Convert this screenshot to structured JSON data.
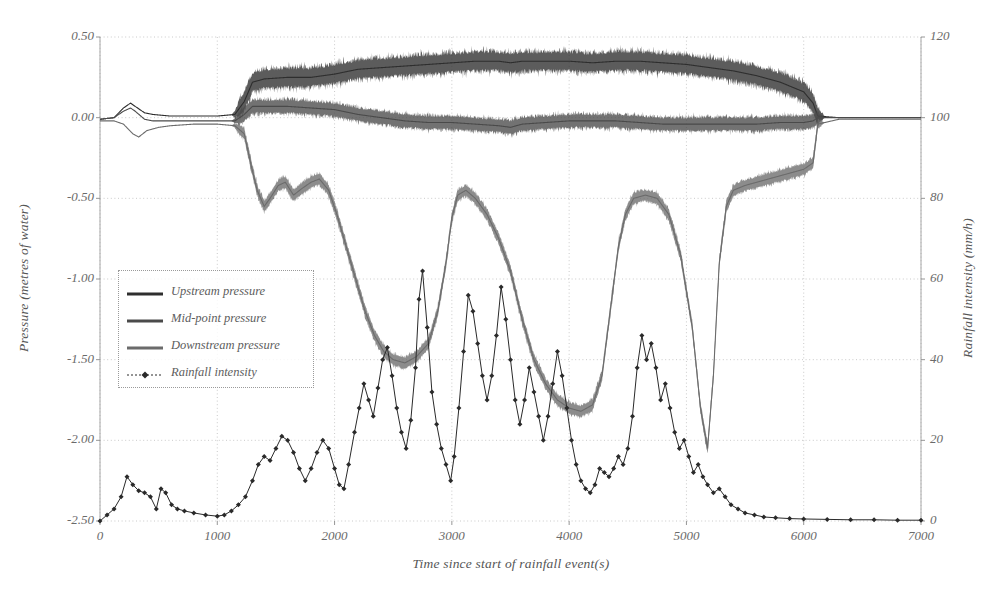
{
  "chart_data": {
    "type": "line",
    "title": "",
    "subtitle": "",
    "xlabel": "Time since start of rainfall event(s)",
    "ylabel": "Pressure (metres of water)",
    "ylabel_right": "Rainfall intensity (mm/h)",
    "xlim": [
      0,
      7000
    ],
    "ylim": [
      -2.5,
      0.5
    ],
    "ylim_right": [
      0,
      120
    ],
    "xticks": [
      0,
      1000,
      2000,
      3000,
      4000,
      5000,
      6000,
      7000
    ],
    "xticklabels": [
      "0",
      "1000",
      "2000",
      "3000",
      "4000",
      "5000",
      "6000",
      "7000"
    ],
    "yticks": [
      0.5,
      0.0,
      -0.5,
      -1.0,
      -1.5,
      -2.0,
      -2.5
    ],
    "yticklabels": [
      "0.50",
      "0.00",
      "-0.50",
      "-1.00",
      "-1.50",
      "-2.00",
      "-2.50"
    ],
    "yticks_right": [
      0,
      20,
      40,
      60,
      80,
      100,
      120
    ],
    "yticklabels_right": [
      "0",
      "20",
      "40",
      "60",
      "80",
      "100",
      "120"
    ],
    "grid": true,
    "grid_style": "dotted",
    "legend_position": "center-left",
    "series": [
      {
        "name": "Upstream pressure",
        "axis": "left",
        "color": "#2e2e2e",
        "style": "solid-noisy",
        "noise": 0.085,
        "points": [
          [
            0,
            -0.01
          ],
          [
            120,
            0.0
          ],
          [
            200,
            0.06
          ],
          [
            260,
            0.09
          ],
          [
            300,
            0.07
          ],
          [
            380,
            0.03
          ],
          [
            450,
            0.02
          ],
          [
            600,
            0.01
          ],
          [
            800,
            0.01
          ],
          [
            1000,
            0.01
          ],
          [
            1150,
            0.02
          ],
          [
            1230,
            0.1
          ],
          [
            1300,
            0.22
          ],
          [
            1400,
            0.24
          ],
          [
            1600,
            0.25
          ],
          [
            1800,
            0.25
          ],
          [
            2000,
            0.27
          ],
          [
            2200,
            0.3
          ],
          [
            2400,
            0.31
          ],
          [
            2600,
            0.32
          ],
          [
            2800,
            0.33
          ],
          [
            3000,
            0.34
          ],
          [
            3200,
            0.35
          ],
          [
            3400,
            0.35
          ],
          [
            3500,
            0.34
          ],
          [
            3600,
            0.35
          ],
          [
            3800,
            0.35
          ],
          [
            4000,
            0.35
          ],
          [
            4200,
            0.34
          ],
          [
            4400,
            0.35
          ],
          [
            4600,
            0.35
          ],
          [
            4800,
            0.34
          ],
          [
            5000,
            0.33
          ],
          [
            5200,
            0.31
          ],
          [
            5400,
            0.29
          ],
          [
            5600,
            0.26
          ],
          [
            5800,
            0.22
          ],
          [
            6000,
            0.16
          ],
          [
            6080,
            0.09
          ],
          [
            6120,
            0.01
          ],
          [
            6300,
            0.0
          ],
          [
            6600,
            0.0
          ],
          [
            7000,
            0.0
          ]
        ]
      },
      {
        "name": "Mid-point pressure",
        "axis": "left",
        "color": "#4a4a4a",
        "style": "solid-noisy",
        "noise": 0.06,
        "points": [
          [
            0,
            -0.01
          ],
          [
            120,
            0.0
          ],
          [
            200,
            0.04
          ],
          [
            260,
            0.06
          ],
          [
            300,
            0.04
          ],
          [
            380,
            -0.01
          ],
          [
            450,
            -0.02
          ],
          [
            600,
            -0.02
          ],
          [
            800,
            -0.02
          ],
          [
            1000,
            -0.02
          ],
          [
            1150,
            -0.02
          ],
          [
            1230,
            0.02
          ],
          [
            1300,
            0.07
          ],
          [
            1400,
            0.07
          ],
          [
            1600,
            0.07
          ],
          [
            1800,
            0.06
          ],
          [
            2000,
            0.05
          ],
          [
            2200,
            0.02
          ],
          [
            2400,
            0.0
          ],
          [
            2600,
            -0.02
          ],
          [
            2800,
            -0.03
          ],
          [
            3000,
            -0.03
          ],
          [
            3200,
            -0.04
          ],
          [
            3400,
            -0.05
          ],
          [
            3500,
            -0.06
          ],
          [
            3600,
            -0.04
          ],
          [
            3800,
            -0.03
          ],
          [
            4000,
            -0.02
          ],
          [
            4200,
            -0.02
          ],
          [
            4400,
            -0.02
          ],
          [
            4600,
            -0.03
          ],
          [
            4800,
            -0.04
          ],
          [
            5000,
            -0.04
          ],
          [
            5200,
            -0.04
          ],
          [
            5400,
            -0.04
          ],
          [
            5600,
            -0.04
          ],
          [
            5800,
            -0.03
          ],
          [
            6000,
            -0.03
          ],
          [
            6080,
            -0.02
          ],
          [
            6120,
            0.0
          ],
          [
            6300,
            0.0
          ],
          [
            6600,
            0.0
          ],
          [
            7000,
            0.0
          ]
        ]
      },
      {
        "name": "Downstream pressure",
        "axis": "left",
        "color": "#6b6b6b",
        "style": "solid-noisy",
        "noise": 0.05,
        "points": [
          [
            0,
            -0.02
          ],
          [
            120,
            -0.02
          ],
          [
            200,
            -0.04
          ],
          [
            280,
            -0.1
          ],
          [
            330,
            -0.12
          ],
          [
            400,
            -0.08
          ],
          [
            500,
            -0.06
          ],
          [
            600,
            -0.05
          ],
          [
            800,
            -0.04
          ],
          [
            1000,
            -0.04
          ],
          [
            1150,
            -0.05
          ],
          [
            1230,
            -0.1
          ],
          [
            1290,
            -0.3
          ],
          [
            1340,
            -0.45
          ],
          [
            1400,
            -0.55
          ],
          [
            1450,
            -0.5
          ],
          [
            1520,
            -0.42
          ],
          [
            1580,
            -0.4
          ],
          [
            1650,
            -0.48
          ],
          [
            1720,
            -0.44
          ],
          [
            1800,
            -0.4
          ],
          [
            1870,
            -0.38
          ],
          [
            1950,
            -0.45
          ],
          [
            2020,
            -0.6
          ],
          [
            2100,
            -0.8
          ],
          [
            2180,
            -1.0
          ],
          [
            2260,
            -1.2
          ],
          [
            2340,
            -1.35
          ],
          [
            2420,
            -1.45
          ],
          [
            2500,
            -1.5
          ],
          [
            2600,
            -1.52
          ],
          [
            2700,
            -1.48
          ],
          [
            2800,
            -1.4
          ],
          [
            2880,
            -1.2
          ],
          [
            2950,
            -0.9
          ],
          [
            3000,
            -0.62
          ],
          [
            3050,
            -0.48
          ],
          [
            3120,
            -0.45
          ],
          [
            3200,
            -0.5
          ],
          [
            3300,
            -0.6
          ],
          [
            3400,
            -0.75
          ],
          [
            3500,
            -0.95
          ],
          [
            3600,
            -1.25
          ],
          [
            3700,
            -1.5
          ],
          [
            3800,
            -1.65
          ],
          [
            3900,
            -1.75
          ],
          [
            4000,
            -1.8
          ],
          [
            4100,
            -1.82
          ],
          [
            4200,
            -1.78
          ],
          [
            4280,
            -1.6
          ],
          [
            4350,
            -1.2
          ],
          [
            4420,
            -0.8
          ],
          [
            4480,
            -0.6
          ],
          [
            4550,
            -0.5
          ],
          [
            4650,
            -0.48
          ],
          [
            4750,
            -0.5
          ],
          [
            4850,
            -0.6
          ],
          [
            4950,
            -0.85
          ],
          [
            5050,
            -1.3
          ],
          [
            5120,
            -1.8
          ],
          [
            5180,
            -2.05
          ],
          [
            5230,
            -1.6
          ],
          [
            5280,
            -0.9
          ],
          [
            5340,
            -0.55
          ],
          [
            5400,
            -0.45
          ],
          [
            5500,
            -0.42
          ],
          [
            5600,
            -0.4
          ],
          [
            5700,
            -0.38
          ],
          [
            5800,
            -0.36
          ],
          [
            5900,
            -0.34
          ],
          [
            6000,
            -0.32
          ],
          [
            6080,
            -0.28
          ],
          [
            6120,
            -0.04
          ],
          [
            6300,
            -0.01
          ],
          [
            6600,
            -0.01
          ],
          [
            7000,
            -0.01
          ]
        ]
      },
      {
        "name": "Rainfall intensity",
        "axis": "right",
        "color": "#2a2a2a",
        "style": "line-markers",
        "marker": "diamond",
        "points": [
          [
            0,
            0
          ],
          [
            60,
            1.5
          ],
          [
            120,
            3
          ],
          [
            180,
            6
          ],
          [
            230,
            11
          ],
          [
            280,
            9
          ],
          [
            330,
            7.5
          ],
          [
            380,
            7
          ],
          [
            430,
            6
          ],
          [
            480,
            3
          ],
          [
            520,
            8
          ],
          [
            560,
            7
          ],
          [
            610,
            4
          ],
          [
            660,
            3
          ],
          [
            720,
            2.5
          ],
          [
            800,
            2
          ],
          [
            900,
            1.5
          ],
          [
            1000,
            1.2
          ],
          [
            1060,
            1.5
          ],
          [
            1120,
            2.5
          ],
          [
            1180,
            4
          ],
          [
            1240,
            6
          ],
          [
            1300,
            10
          ],
          [
            1350,
            14
          ],
          [
            1400,
            16
          ],
          [
            1450,
            15
          ],
          [
            1500,
            18
          ],
          [
            1550,
            21
          ],
          [
            1600,
            20
          ],
          [
            1650,
            17
          ],
          [
            1700,
            13
          ],
          [
            1750,
            10
          ],
          [
            1800,
            13
          ],
          [
            1850,
            17
          ],
          [
            1900,
            20
          ],
          [
            1950,
            18
          ],
          [
            2000,
            13
          ],
          [
            2040,
            9
          ],
          [
            2080,
            8
          ],
          [
            2120,
            14
          ],
          [
            2170,
            22
          ],
          [
            2210,
            28
          ],
          [
            2250,
            34
          ],
          [
            2290,
            30
          ],
          [
            2330,
            26
          ],
          [
            2370,
            33
          ],
          [
            2410,
            40
          ],
          [
            2450,
            43
          ],
          [
            2490,
            36
          ],
          [
            2530,
            28
          ],
          [
            2570,
            22
          ],
          [
            2610,
            18
          ],
          [
            2650,
            25
          ],
          [
            2690,
            38
          ],
          [
            2720,
            55
          ],
          [
            2750,
            62
          ],
          [
            2790,
            48
          ],
          [
            2830,
            32
          ],
          [
            2870,
            24
          ],
          [
            2910,
            18
          ],
          [
            2950,
            14
          ],
          [
            2990,
            10
          ],
          [
            3020,
            16
          ],
          [
            3060,
            28
          ],
          [
            3100,
            42
          ],
          [
            3140,
            56
          ],
          [
            3180,
            52
          ],
          [
            3220,
            44
          ],
          [
            3260,
            36
          ],
          [
            3300,
            30
          ],
          [
            3340,
            36
          ],
          [
            3380,
            46
          ],
          [
            3420,
            58
          ],
          [
            3460,
            50
          ],
          [
            3500,
            40
          ],
          [
            3540,
            30
          ],
          [
            3580,
            24
          ],
          [
            3620,
            30
          ],
          [
            3660,
            38
          ],
          [
            3700,
            32
          ],
          [
            3740,
            26
          ],
          [
            3780,
            20
          ],
          [
            3820,
            26
          ],
          [
            3860,
            34
          ],
          [
            3900,
            42
          ],
          [
            3940,
            36
          ],
          [
            3980,
            28
          ],
          [
            4020,
            20
          ],
          [
            4060,
            14
          ],
          [
            4100,
            10
          ],
          [
            4140,
            8
          ],
          [
            4180,
            7
          ],
          [
            4220,
            9
          ],
          [
            4260,
            13
          ],
          [
            4300,
            12
          ],
          [
            4340,
            11
          ],
          [
            4380,
            13
          ],
          [
            4420,
            16
          ],
          [
            4460,
            14
          ],
          [
            4500,
            18
          ],
          [
            4540,
            26
          ],
          [
            4580,
            38
          ],
          [
            4620,
            46
          ],
          [
            4660,
            40
          ],
          [
            4700,
            44
          ],
          [
            4740,
            38
          ],
          [
            4780,
            30
          ],
          [
            4820,
            34
          ],
          [
            4860,
            28
          ],
          [
            4900,
            22
          ],
          [
            4940,
            18
          ],
          [
            4980,
            20
          ],
          [
            5020,
            16
          ],
          [
            5060,
            12
          ],
          [
            5100,
            14
          ],
          [
            5140,
            11
          ],
          [
            5180,
            9
          ],
          [
            5230,
            7
          ],
          [
            5280,
            8
          ],
          [
            5330,
            6
          ],
          [
            5380,
            4
          ],
          [
            5440,
            3
          ],
          [
            5500,
            2
          ],
          [
            5580,
            1.5
          ],
          [
            5660,
            1
          ],
          [
            5760,
            0.8
          ],
          [
            5880,
            0.6
          ],
          [
            6000,
            0.5
          ],
          [
            6200,
            0.4
          ],
          [
            6400,
            0.3
          ],
          [
            6600,
            0.3
          ],
          [
            6800,
            0.2
          ],
          [
            7000,
            0.2
          ]
        ]
      }
    ]
  },
  "legend": {
    "items": [
      {
        "label": "Upstream pressure"
      },
      {
        "label": "Mid-point pressure"
      },
      {
        "label": "Downstream pressure"
      },
      {
        "label": "Rainfall intensity"
      }
    ]
  },
  "top_caption": ""
}
